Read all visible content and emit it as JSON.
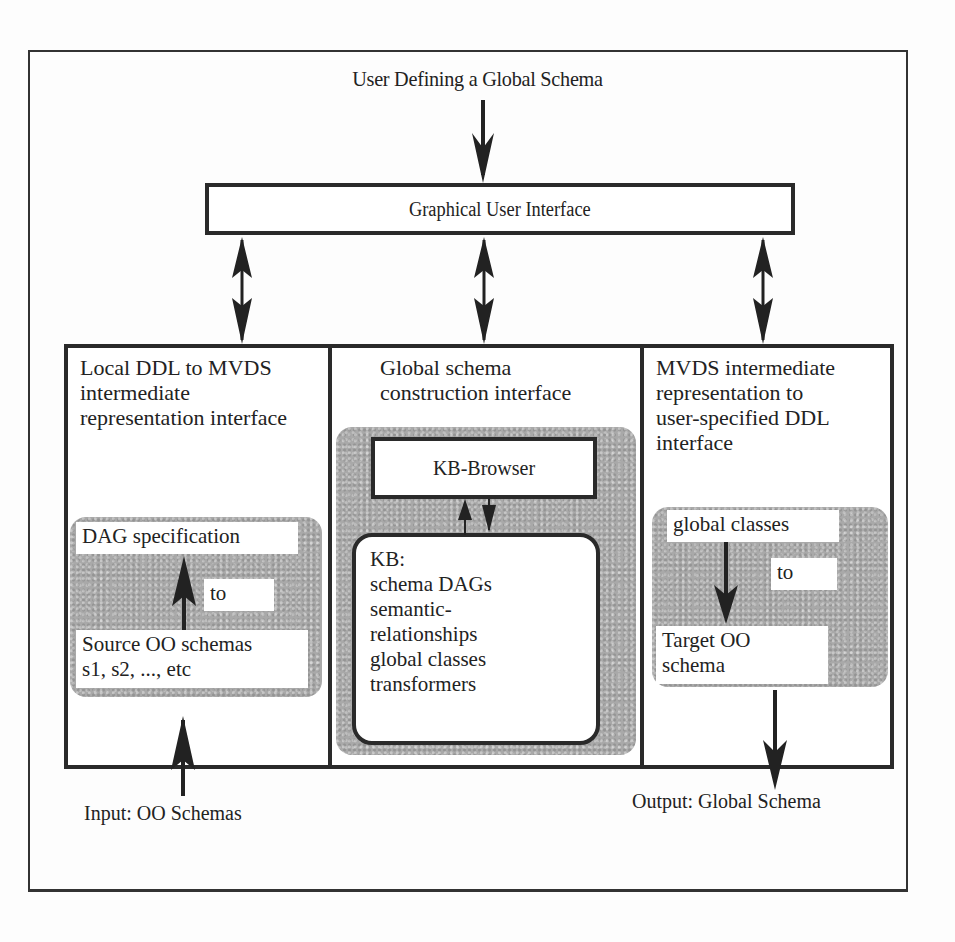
{
  "diagram": {
    "title": "User Defining a Global Schema",
    "gui": {
      "label": "Graphical User Interface"
    },
    "panels": [
      {
        "heading_lines": [
          "Local DDL to MVDS",
          "intermediate",
          "representation interface"
        ],
        "top_label": "DAG specification",
        "connector_label": "to",
        "bottom_lines": [
          "Source OO schemas",
          "s1, s2, ..., etc"
        ],
        "arrow_direction": "up"
      },
      {
        "heading_lines": [
          "Global schema",
          "construction interface"
        ],
        "browser_label": "KB-Browser",
        "kb_lines": [
          "KB:",
          "schema DAGs",
          "semantic-",
          "relationships",
          "global classes",
          "transformers"
        ]
      },
      {
        "heading_lines": [
          "MVDS intermediate",
          "representation to",
          "user-specified DDL",
          "interface"
        ],
        "top_label": "global classes",
        "connector_label": "to",
        "bottom_lines": [
          "Target OO",
          "schema"
        ],
        "arrow_direction": "down"
      }
    ],
    "input_label": "Input: OO Schemas",
    "output_label": "Output: Global Schema",
    "colors": {
      "line": "#2a2a2a",
      "shade": "#a9a9a9",
      "background": "#fdfdfd"
    }
  }
}
